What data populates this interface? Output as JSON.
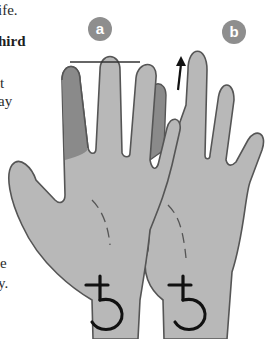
{
  "text_fragments": [
    {
      "text": "ife.",
      "style": "regular"
    },
    {
      "text": "hird",
      "style": "bold"
    },
    {
      "text": "t",
      "style": "regular"
    },
    {
      "text": "ay",
      "style": "regular"
    },
    {
      "text": "e",
      "style": "regular"
    },
    {
      "text": "y.",
      "style": "regular"
    }
  ],
  "illustration": {
    "labels": [
      "a",
      "b"
    ],
    "wrist_symbol": "♄",
    "colors": {
      "hand_fill": "#b8b8b8",
      "highlight_finger_fill": "#8a8a8a",
      "outline": "#555555",
      "label_bg": "#8e8e8e"
    },
    "icons": [
      "saturn-symbol-icon",
      "up-arrow-icon",
      "measure-line"
    ]
  }
}
